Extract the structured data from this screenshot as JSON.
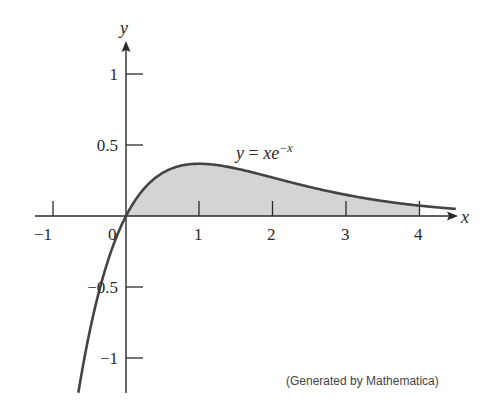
{
  "chart_data": {
    "type": "area",
    "title": "",
    "function": "y = xe^-x",
    "annotation": "y = xe−x",
    "xlabel": "x",
    "ylabel": "y",
    "xlim": [
      -1.2,
      4.5
    ],
    "ylim": [
      -1.25,
      1.2
    ],
    "x_ticks": [
      -1,
      0,
      1,
      2,
      3,
      4
    ],
    "x_tick_labels": [
      "−1",
      "0",
      "1",
      "2",
      "3",
      "4"
    ],
    "y_ticks": [
      1,
      0.5,
      -0.5,
      -1
    ],
    "y_tick_labels": [
      "1",
      "0.5",
      "−0.5",
      "−1"
    ],
    "shaded_region": {
      "from_x": 0,
      "to_x": 4,
      "fill": "#d4d4d4"
    },
    "curve_domain": [
      -0.65,
      4.5
    ],
    "sample_points": [
      {
        "x": -0.6,
        "y": -1.09
      },
      {
        "x": -0.3,
        "y": -0.4
      },
      {
        "x": 0,
        "y": 0
      },
      {
        "x": 0.5,
        "y": 0.3
      },
      {
        "x": 1,
        "y": 0.368
      },
      {
        "x": 2,
        "y": 0.271
      },
      {
        "x": 3,
        "y": 0.149
      },
      {
        "x": 4,
        "y": 0.073
      },
      {
        "x": 4.5,
        "y": 0.05
      }
    ],
    "grid": false,
    "legend": "none",
    "curve_color": "#444444"
  },
  "labels": {
    "y_axis": "y",
    "x_axis": "x",
    "equation_y": "y",
    "equation_eq": " = ",
    "equation_x": "xe",
    "equation_exp": "−x",
    "credit": "(Generated by Mathematica)",
    "ticks_x": [
      "−1",
      "0",
      "1",
      "2",
      "3",
      "4"
    ],
    "ticks_y": [
      "1",
      "0.5",
      "−0.5",
      "−1"
    ]
  }
}
